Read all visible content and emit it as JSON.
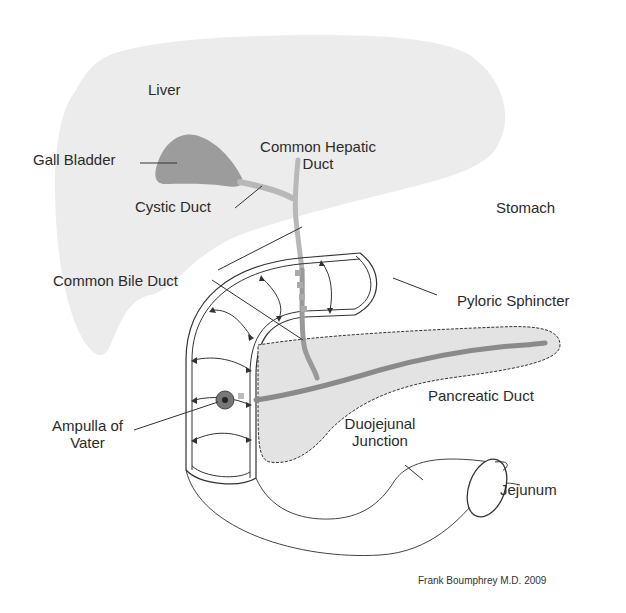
{
  "diagram": {
    "type": "anatomical-illustration",
    "colors": {
      "liver_fill": "#ececec",
      "gallbladder_fill": "#9c9c9c",
      "duct_stroke": "#b8b8b8",
      "pancreatic_duct": "#8a8a8a",
      "pancreas_fill": "#e3e3e3",
      "outline": "#333333",
      "text": "#2b2b2b"
    }
  },
  "labels": {
    "liver": "Liver",
    "gall_bladder": "Gall Bladder",
    "common_hepatic_duct_line1": "Common Hepatic",
    "common_hepatic_duct_line2": "Duct",
    "cystic_duct": "Cystic Duct",
    "stomach": "Stomach",
    "common_bile_duct": "Common Bile Duct",
    "pyloric_sphincter": "Pyloric Sphincter",
    "pancreatic_duct": "Pancreatic Duct",
    "ampulla_line1": "Ampulla of",
    "ampulla_line2": "Vater",
    "duojejunal_line1": "Duojejunal",
    "duojejunal_line2": "Junction",
    "jejunum": "Jejunum"
  },
  "credit": "Frank Boumphrey M.D. 2009"
}
